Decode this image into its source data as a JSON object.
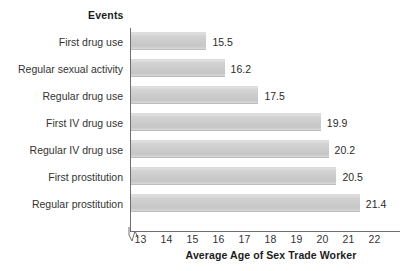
{
  "chart_data": {
    "type": "bar",
    "orientation": "horizontal",
    "title": "",
    "category_axis_title": "Events",
    "xlabel": "Average Age of Sex Trade Worker",
    "ylabel": "",
    "categories": [
      "First drug use",
      "Regular sexual activity",
      "Regular drug use",
      "First IV drug use",
      "Regular IV drug use",
      "First prostitution",
      "Regular prostitution"
    ],
    "values": [
      15.5,
      16.2,
      17.5,
      19.9,
      20.2,
      20.5,
      21.4
    ],
    "value_labels": [
      "15.5",
      "16.2",
      "17.5",
      "19.9",
      "20.2",
      "20.5",
      "21.4"
    ],
    "xticks": [
      13,
      14,
      15,
      16,
      17,
      18,
      19,
      20,
      21,
      22
    ],
    "xtick_labels": [
      "13",
      "14",
      "15",
      "16",
      "17",
      "18",
      "19",
      "20",
      "21",
      "22"
    ],
    "xlim": [
      12.6,
      22.4
    ],
    "axis_break": true,
    "grid": false,
    "legend": null,
    "bar_color": "#cbcbcb",
    "axis_color": "#6e6e6e",
    "text_color": "#333333"
  }
}
